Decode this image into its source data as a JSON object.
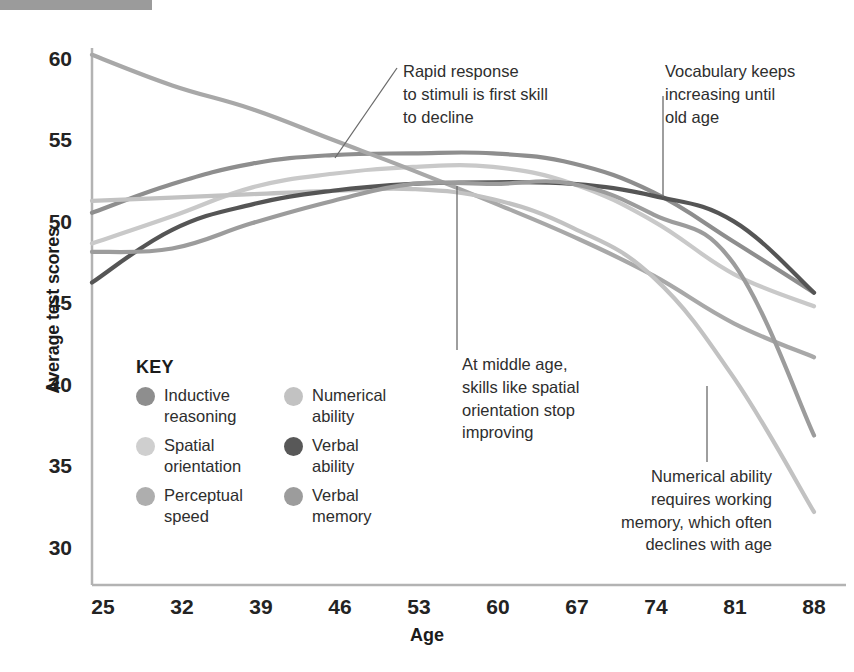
{
  "chart_data": {
    "type": "line",
    "title": "",
    "xlabel": "Age",
    "ylabel": "Average test scores",
    "xlim": [
      25,
      88
    ],
    "ylim": [
      28.8,
      60.4
    ],
    "grid": false,
    "legend_position": "inside-lower-left",
    "x": [
      25,
      32,
      39,
      46,
      53,
      60,
      67,
      74,
      81,
      88
    ],
    "xticks": [
      "25",
      "32",
      "39",
      "46",
      "53",
      "60",
      "67",
      "74",
      "81",
      "88"
    ],
    "yticks": [
      "30",
      "35",
      "40",
      "45",
      "50",
      "55",
      "60"
    ],
    "series": [
      {
        "name": "Inductive reasoning",
        "color": "#8e8e8e",
        "values": [
          50.7,
          52.4,
          53.6,
          54.1,
          54.2,
          54.2,
          53.6,
          51.9,
          49.0,
          46.0
        ]
      },
      {
        "name": "Spatial orientation",
        "color": "#c9c9c9",
        "values": [
          48.9,
          50.5,
          52.2,
          53.0,
          53.4,
          53.4,
          52.4,
          50.2,
          47.1,
          45.2
        ]
      },
      {
        "name": "Perceptual speed",
        "color": "#a8a8a8",
        "values": [
          60.0,
          58.2,
          56.8,
          55.0,
          53.2,
          51.3,
          49.3,
          47.0,
          44.2,
          42.2
        ]
      },
      {
        "name": "Numerical ability",
        "color": "#c2c2c2",
        "values": [
          51.4,
          51.6,
          51.8,
          52.0,
          52.1,
          51.5,
          49.8,
          46.9,
          41.0,
          33.1
        ]
      },
      {
        "name": "Verbal ability",
        "color": "#555555",
        "values": [
          46.6,
          49.7,
          51.2,
          52.0,
          52.4,
          52.5,
          52.4,
          51.7,
          50.2,
          46.0
        ]
      },
      {
        "name": "Verbal memory",
        "color": "#9c9c9c",
        "values": [
          48.4,
          48.6,
          50.1,
          51.4,
          52.4,
          52.4,
          52.4,
          50.6,
          47.7,
          37.6
        ]
      }
    ]
  },
  "axes": {
    "y_title": "Average test scores",
    "x_title": "Age"
  },
  "legend": {
    "title": "KEY",
    "items": [
      {
        "label": "Inductive\nreasoning",
        "color": "#8e8e8e"
      },
      {
        "label": "Numerical\nability",
        "color": "#c2c2c2"
      },
      {
        "label": "Spatial\norientation",
        "color": "#cfcfcf"
      },
      {
        "label": "Verbal\nability",
        "color": "#585858"
      },
      {
        "label": "Perceptual\nspeed",
        "color": "#aeaeae"
      },
      {
        "label": "Verbal\nmemory",
        "color": "#9c9c9c"
      }
    ]
  },
  "annotations": [
    {
      "id": "rapid",
      "text": "Rapid response\nto stimuli is first skill\nto decline"
    },
    {
      "id": "vocabulary",
      "text": "Vocabulary keeps\nincreasing until\nold age"
    },
    {
      "id": "middle-age",
      "text": "At middle age,\nskills like spatial\norientation stop\nimproving"
    },
    {
      "id": "numerical",
      "text": "Numerical ability\nrequires working\nmemory, which often\ndeclines with age"
    }
  ],
  "colors": {
    "axis": "#b0b0b0",
    "text": "#232323",
    "top_bar": "#9b9b9b"
  }
}
